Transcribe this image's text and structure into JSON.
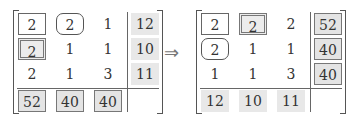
{
  "left_matrix": {
    "rows": [
      [
        {
          "v": "2",
          "style": "box"
        },
        {
          "v": "2",
          "style": "rbox"
        },
        {
          "v": "1",
          "style": "plain"
        },
        {
          "v": "12",
          "style": "shade"
        }
      ],
      [
        {
          "v": "2",
          "style": "dbox"
        },
        {
          "v": "1",
          "style": "plain"
        },
        {
          "v": "1",
          "style": "plain"
        },
        {
          "v": "10",
          "style": "shade"
        }
      ],
      [
        {
          "v": "2",
          "style": "plain"
        },
        {
          "v": "1",
          "style": "plain"
        },
        {
          "v": "3",
          "style": "plain"
        },
        {
          "v": "11",
          "style": "shade"
        }
      ],
      [
        {
          "v": "52",
          "style": "shadebox"
        },
        {
          "v": "40",
          "style": "shadebox"
        },
        {
          "v": "40",
          "style": "shadebox"
        },
        {
          "v": "",
          "style": "plain"
        }
      ]
    ]
  },
  "arrow": "⇒",
  "right_matrix": {
    "rows": [
      [
        {
          "v": "2",
          "style": "box"
        },
        {
          "v": "2",
          "style": "dbox"
        },
        {
          "v": "2",
          "style": "plain"
        },
        {
          "v": "52",
          "style": "shadebox"
        }
      ],
      [
        {
          "v": "2",
          "style": "rbox"
        },
        {
          "v": "1",
          "style": "plain"
        },
        {
          "v": "1",
          "style": "plain"
        },
        {
          "v": "40",
          "style": "shadebox"
        }
      ],
      [
        {
          "v": "1",
          "style": "plain"
        },
        {
          "v": "1",
          "style": "plain"
        },
        {
          "v": "3",
          "style": "plain"
        },
        {
          "v": "40",
          "style": "shadebox"
        }
      ],
      [
        {
          "v": "12",
          "style": "shade"
        },
        {
          "v": "10",
          "style": "shade"
        },
        {
          "v": "11",
          "style": "shade"
        },
        {
          "v": "",
          "style": "plain"
        }
      ]
    ]
  }
}
